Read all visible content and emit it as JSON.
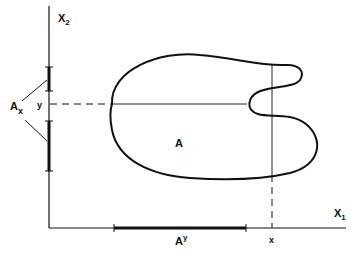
{
  "figure": {
    "width": 351,
    "height": 260,
    "ink_color": "#111111",
    "background": "#ffffff"
  },
  "axes": {
    "x_axis_label": "X",
    "x_axis_subscript": "1",
    "y_axis_label": "X",
    "y_axis_subscript": "2"
  },
  "set": {
    "label": "A"
  },
  "projections": {
    "x_section_label": "A",
    "x_section_subscript": "x",
    "y_section_label": "A",
    "y_section_superscript": "y"
  },
  "points": {
    "x_label": "x",
    "y_label": "y"
  }
}
